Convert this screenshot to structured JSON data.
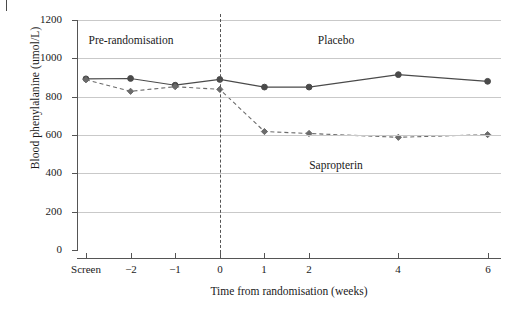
{
  "chart_data": {
    "type": "line",
    "title": "",
    "xlabel": "Time from randomisation (weeks)",
    "ylabel": "Blood phenylalanine (umol/L)",
    "categories": [
      "Screen",
      "−2",
      "−1",
      "0",
      "1",
      "2",
      "4",
      "6"
    ],
    "x_tick_labels": [
      "Screen",
      "−2",
      "−1",
      "0",
      "1",
      "2",
      "4",
      "6"
    ],
    "x_numeric": [
      -3,
      -2,
      -1,
      0,
      1,
      2,
      4,
      6
    ],
    "xlim": [
      -3.2,
      6.3
    ],
    "ylim": [
      0,
      1200
    ],
    "y_ticks": [
      0,
      200,
      400,
      600,
      800,
      1000,
      1200
    ],
    "y_tick_labels": [
      "0",
      "200",
      "400",
      "600",
      "800",
      "1000",
      "1200"
    ],
    "grid": "horizontal",
    "legend": "none",
    "series": [
      {
        "name": "Placebo",
        "line_style": "solid",
        "color": "#4a4a4a",
        "marker": "circle",
        "values": [
          893,
          895,
          860,
          890,
          850,
          850,
          915,
          880
        ]
      },
      {
        "name": "Sapropterin",
        "line_style": "dashed",
        "color": "#6b6b6b",
        "marker": "diamond",
        "values": [
          888,
          828,
          852,
          838,
          618,
          608,
          588,
          602
        ]
      }
    ],
    "annotations": [
      {
        "text": "Pre-randomisation",
        "x_numeric": -2.0,
        "y_value": 1090
      },
      {
        "text": "Placebo",
        "x_numeric": 2.6,
        "y_value": 1090
      },
      {
        "text": "Sapropterin",
        "x_numeric": 2.6,
        "y_value": 440
      }
    ],
    "reference_lines": [
      {
        "name": "randomisation",
        "x_numeric": 0,
        "style": "dashed",
        "color": "#555555"
      }
    ],
    "colors": {
      "placebo_line": "#4a4a4a",
      "sapropterin_line": "#6b6b6b",
      "grid": "#c9c9c9",
      "axis": "#555555",
      "text": "#1a1a1a",
      "background": "#ffffff"
    }
  }
}
